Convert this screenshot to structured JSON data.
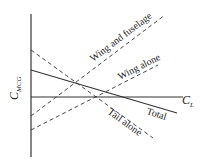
{
  "diagram": {
    "y_axis_label": "C",
    "y_axis_subscript": "MCG",
    "x_axis_label": "C",
    "x_axis_subscript": "L",
    "lines": [
      {
        "name": "Wing and fuselage",
        "style": "dashed"
      },
      {
        "name": "Wing alone",
        "style": "dashed"
      },
      {
        "name": "Tail alone",
        "style": "dashed"
      },
      {
        "name": "Total",
        "style": "solid"
      }
    ],
    "colors": {
      "line": "#333333",
      "background": "#ffffff"
    }
  }
}
